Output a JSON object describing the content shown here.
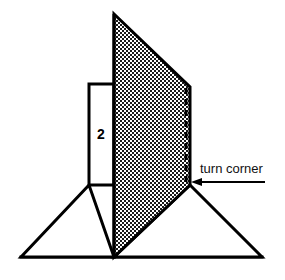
{
  "figure": {
    "background_color": "#ffffff",
    "line_color": "#000000",
    "fill_white": "#ffffff",
    "hatch_color": "#1a1a1a",
    "labels": {
      "dimension": "2",
      "callout": "turn corner"
    },
    "shapes": {
      "shaded_panel": {
        "name": "shaded-panel",
        "fill": "checkerboard",
        "points": "114,14 190,87 190,185 114,257"
      },
      "white_rectangle": {
        "name": "white-rectangle",
        "fill": "#ffffff",
        "points": "89,84 114,84 114,185 89,185"
      },
      "left_triangle": {
        "name": "left-triangle",
        "fill": "#ffffff",
        "points": "89,185 21,257 114,257"
      },
      "right_triangle": {
        "name": "right-triangle",
        "fill": "#ffffff",
        "points": "190,185 262,257 114,257"
      },
      "dashed_edge": {
        "name": "dashed-inner-edge",
        "x": 186,
        "y1": 88,
        "y2": 184
      },
      "arrow": {
        "name": "callout-arrow",
        "tail_x": 265,
        "tip_x": 193,
        "y": 182
      }
    },
    "label_positions": {
      "dimension": {
        "x": 101,
        "y": 139
      },
      "callout": {
        "x": 200,
        "y": 173
      }
    }
  }
}
